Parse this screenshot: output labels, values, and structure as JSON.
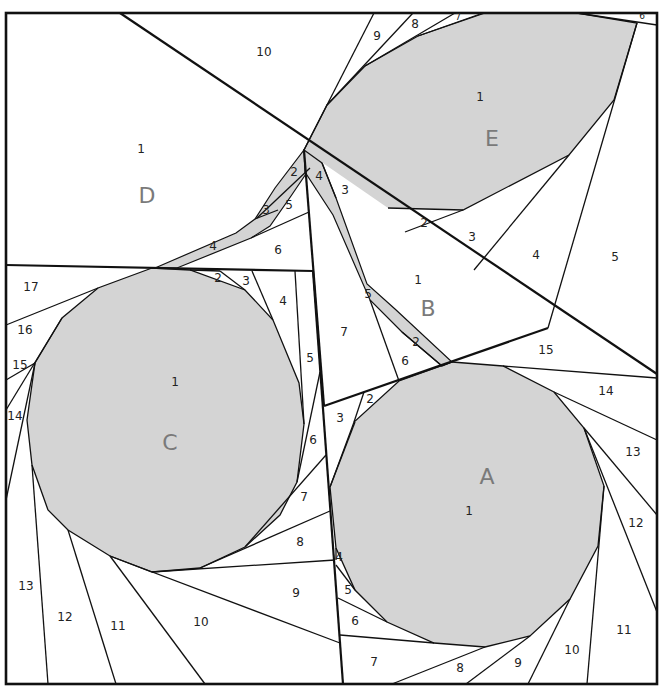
{
  "diagram": {
    "fill_color": "#d4d4d4",
    "line_color": "#111111",
    "sections": [
      {
        "id": "A",
        "letter_pos": [
          487,
          478
        ],
        "pieces": [
          {
            "n": "1",
            "pos": [
              469,
              511
            ]
          },
          {
            "n": "2",
            "pos": [
              370,
              399
            ]
          },
          {
            "n": "3",
            "pos": [
              340,
              418
            ]
          },
          {
            "n": "4",
            "pos": [
              339,
              557
            ]
          },
          {
            "n": "5",
            "pos": [
              348,
              590
            ]
          },
          {
            "n": "6",
            "pos": [
              355,
              621
            ]
          },
          {
            "n": "7",
            "pos": [
              374,
              662
            ]
          },
          {
            "n": "8",
            "pos": [
              460,
              668
            ]
          },
          {
            "n": "9",
            "pos": [
              518,
              663
            ]
          },
          {
            "n": "10",
            "pos": [
              572,
              650
            ]
          },
          {
            "n": "11",
            "pos": [
              624,
              630
            ]
          },
          {
            "n": "12",
            "pos": [
              636,
              523
            ]
          },
          {
            "n": "13",
            "pos": [
              633,
              452
            ]
          },
          {
            "n": "14",
            "pos": [
              606,
              391
            ]
          },
          {
            "n": "15",
            "pos": [
              546,
              350
            ]
          }
        ]
      },
      {
        "id": "B",
        "letter_pos": [
          428,
          310
        ],
        "pieces": [
          {
            "n": "1",
            "pos": [
              418,
              280
            ]
          },
          {
            "n": "2",
            "pos": [
              416,
              342
            ]
          },
          {
            "n": "3",
            "pos": [
              345,
              190
            ]
          },
          {
            "n": "4",
            "pos": [
              319,
              176
            ]
          },
          {
            "n": "5",
            "pos": [
              368,
              294
            ]
          },
          {
            "n": "6",
            "pos": [
              405,
              361
            ]
          },
          {
            "n": "7",
            "pos": [
              344,
              332
            ]
          }
        ]
      },
      {
        "id": "C",
        "letter_pos": [
          170,
          444
        ],
        "pieces": [
          {
            "n": "1",
            "pos": [
              175,
              382
            ]
          },
          {
            "n": "2",
            "pos": [
              218,
              278
            ]
          },
          {
            "n": "3",
            "pos": [
              246,
              281
            ]
          },
          {
            "n": "4",
            "pos": [
              283,
              301
            ]
          },
          {
            "n": "5",
            "pos": [
              310,
              358
            ]
          },
          {
            "n": "6",
            "pos": [
              313,
              440
            ]
          },
          {
            "n": "7",
            "pos": [
              304,
              497
            ]
          },
          {
            "n": "8",
            "pos": [
              300,
              542
            ]
          },
          {
            "n": "9",
            "pos": [
              296,
              593
            ]
          },
          {
            "n": "10",
            "pos": [
              201,
              622
            ]
          },
          {
            "n": "11",
            "pos": [
              118,
              626
            ]
          },
          {
            "n": "12",
            "pos": [
              65,
              617
            ]
          },
          {
            "n": "13",
            "pos": [
              26,
              586
            ]
          },
          {
            "n": "14",
            "pos": [
              15,
              416
            ]
          },
          {
            "n": "15",
            "pos": [
              20,
              365
            ]
          },
          {
            "n": "16",
            "pos": [
              25,
              330
            ]
          },
          {
            "n": "17",
            "pos": [
              31,
              287
            ]
          }
        ]
      },
      {
        "id": "D",
        "letter_pos": [
          147,
          197
        ],
        "pieces": [
          {
            "n": "1",
            "pos": [
              141,
              149
            ]
          },
          {
            "n": "2",
            "pos": [
              294,
              172
            ]
          },
          {
            "n": "3",
            "pos": [
              266,
              210
            ]
          },
          {
            "n": "4",
            "pos": [
              213,
              246
            ]
          },
          {
            "n": "5",
            "pos": [
              289,
              205
            ]
          },
          {
            "n": "6",
            "pos": [
              278,
              250
            ]
          },
          {
            "n": "10",
            "pos": [
              264,
              52
            ]
          }
        ]
      },
      {
        "id": "E",
        "letter_pos": [
          492,
          140
        ],
        "pieces": [
          {
            "n": "1",
            "pos": [
              480,
              97
            ]
          },
          {
            "n": "2",
            "pos": [
              424,
              223
            ]
          },
          {
            "n": "3",
            "pos": [
              472,
              237
            ]
          },
          {
            "n": "4",
            "pos": [
              536,
              255
            ]
          },
          {
            "n": "5",
            "pos": [
              615,
              257
            ]
          },
          {
            "n": "6",
            "pos": [
              642,
              16
            ]
          },
          {
            "n": "7",
            "pos": [
              458,
              17
            ]
          },
          {
            "n": "8",
            "pos": [
              415,
              24
            ]
          },
          {
            "n": "9",
            "pos": [
              377,
              36
            ]
          }
        ]
      }
    ]
  }
}
